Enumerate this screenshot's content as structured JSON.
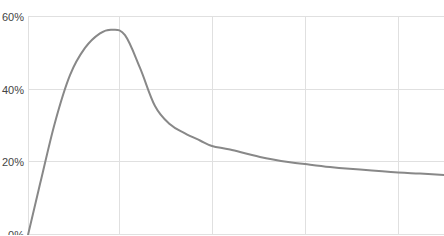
{
  "chart_data": {
    "type": "line",
    "title": "",
    "xlabel": "",
    "ylabel": "",
    "ylim": [
      0,
      60
    ],
    "y_ticks": [
      0,
      20,
      40,
      60
    ],
    "y_tick_labels": [
      "0%",
      "20%",
      "40%",
      "60%"
    ],
    "grid": true,
    "legend": null,
    "series": [
      {
        "name": "series-1",
        "color": "#888888",
        "x": [
          28,
          40,
          55,
          70,
          85,
          100,
          112,
          125,
          140,
          155,
          170,
          185,
          200,
          212,
          230,
          260,
          290,
          305,
          330,
          360,
          398,
          420,
          444
        ],
        "values": [
          0,
          14,
          31,
          44,
          51.5,
          55.5,
          56.5,
          55,
          46,
          35.5,
          30.5,
          28,
          26,
          24.5,
          23.5,
          21.5,
          20,
          19.5,
          18.7,
          18,
          17.2,
          16.9,
          16.5
        ]
      }
    ]
  },
  "colors": {
    "grid": "#e0e0e0",
    "line": "#888888",
    "label": "#444444"
  },
  "layout": {
    "plot_left": 28,
    "plot_right": 444,
    "y_top_px": 17,
    "y_bottom_px": 235,
    "vertical_grid_x": [
      28,
      119,
      212,
      305,
      398
    ]
  }
}
